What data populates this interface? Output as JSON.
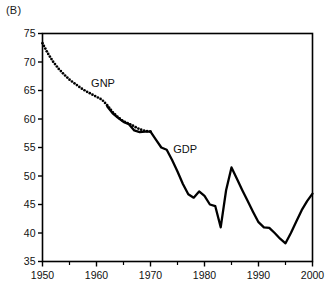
{
  "panel": {
    "label": "(B)"
  },
  "chart_data": {
    "type": "line",
    "title": "",
    "subtitle": "",
    "xlabel": "",
    "ylabel": "",
    "xlim": [
      1950,
      2000
    ],
    "ylim": [
      35,
      75
    ],
    "grid": false,
    "legend_position": "inline-annotation",
    "x_ticks_major": [
      1950,
      1960,
      1970,
      1980,
      1990,
      2000
    ],
    "x_ticks_minor": [
      1955,
      1965,
      1975,
      1985,
      1995
    ],
    "x_tick_labels": [
      "1950",
      "1960",
      "1970",
      "1980",
      "1990",
      "2000"
    ],
    "y_ticks": [
      35,
      40,
      45,
      50,
      55,
      60,
      65,
      70,
      75
    ],
    "y_tick_labels": [
      "35",
      "40",
      "45",
      "50",
      "55",
      "60",
      "65",
      "70",
      "75"
    ],
    "annotations": [
      {
        "text": "GNP",
        "x": 1959.0,
        "y": 65.6
      },
      {
        "text": "GDP",
        "x": 1974.2,
        "y": 54.0
      }
    ],
    "series": [
      {
        "name": "GNP",
        "style": "dotted",
        "color": "#000000",
        "x": [
          1950,
          1951,
          1952,
          1953,
          1954,
          1955,
          1956,
          1957,
          1958,
          1959,
          1960,
          1961,
          1962,
          1963,
          1964,
          1965,
          1966,
          1967,
          1968,
          1969,
          1970
        ],
        "values": [
          73.3,
          71.5,
          70.0,
          68.8,
          67.8,
          66.9,
          66.2,
          65.5,
          64.9,
          64.4,
          63.9,
          63.4,
          62.4,
          61.2,
          60.3,
          59.6,
          59.2,
          58.7,
          58.2,
          57.9,
          57.8
        ]
      },
      {
        "name": "GDP",
        "style": "solid",
        "color": "#000000",
        "x": [
          1962,
          1963,
          1964,
          1965,
          1966,
          1967,
          1968,
          1969,
          1970,
          1971,
          1972,
          1973,
          1974,
          1975,
          1976,
          1977,
          1978,
          1979,
          1980,
          1981,
          1982,
          1983,
          1984,
          1985,
          1986,
          1987,
          1988,
          1989,
          1990,
          1991,
          1992,
          1993,
          1994,
          1995,
          1996,
          1997,
          1998,
          1999,
          2000
        ],
        "values": [
          62.2,
          61.0,
          60.2,
          59.5,
          59.1,
          58.0,
          57.7,
          57.8,
          57.8,
          56.4,
          55.0,
          54.6,
          52.8,
          50.8,
          48.6,
          46.8,
          46.2,
          47.3,
          46.5,
          45.0,
          44.7,
          41.0,
          47.5,
          51.5,
          49.5,
          47.5,
          45.6,
          43.7,
          41.9,
          41.0,
          40.9,
          40.0,
          39.0,
          38.2,
          40.0,
          42.0,
          44.0,
          45.6,
          46.9
        ]
      }
    ]
  }
}
